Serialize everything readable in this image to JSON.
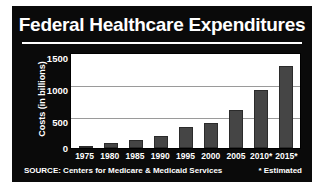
{
  "chart_data": {
    "type": "bar",
    "title": "Federal Healthcare Expenditures",
    "xlabel": "",
    "ylabel": "Costs (in billions)",
    "categories": [
      "1975",
      "1980",
      "1985",
      "1990",
      "1995",
      "2000",
      "2005",
      "2010*",
      "2015*"
    ],
    "values": [
      37,
      75,
      125,
      190,
      330,
      395,
      610,
      930,
      1310
    ],
    "ylim": [
      0,
      1500
    ],
    "yticks": [
      "0",
      "500",
      "1000",
      "1500"
    ],
    "ytick_values": [
      0,
      500,
      1000,
      1500
    ],
    "grid": true,
    "gridlines_at": [
      500,
      1000
    ],
    "legend": "none",
    "bar_color": "#454545",
    "plot_background": "#ffffff",
    "panel_background": "#0a0a0a",
    "text_color": "#ffffff",
    "source": "SOURCE: Centers for Medicare & Medicaid Services",
    "footnote": "* Estimated"
  }
}
